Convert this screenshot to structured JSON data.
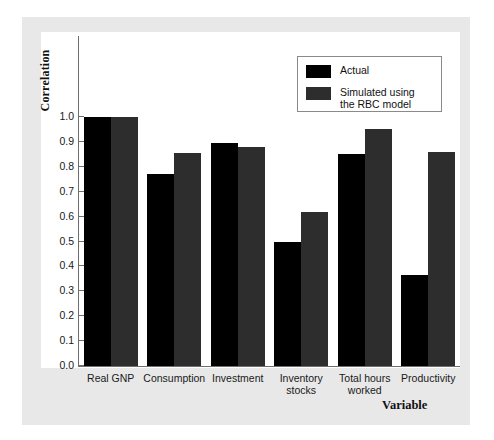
{
  "chart_data": {
    "type": "bar",
    "title": "",
    "xlabel": "Variable",
    "ylabel": "Correlation",
    "categories": [
      "Real GNP",
      "Consumption",
      "Investment",
      "Inventory stocks",
      "Total hours worked",
      "Productivity"
    ],
    "series": [
      {
        "name": "Actual",
        "color": "#000000",
        "values": [
          1.0,
          0.77,
          0.895,
          0.5,
          0.85,
          0.365
        ]
      },
      {
        "name": "Simulated using the RBC model",
        "color": "#2d2d2d",
        "values": [
          1.0,
          0.855,
          0.88,
          0.62,
          0.95,
          0.86
        ]
      }
    ],
    "ylim": [
      0.0,
      1.0
    ],
    "yticks": [
      "0.0",
      "0.1",
      "0.2",
      "0.3",
      "0.4",
      "0.5",
      "0.6",
      "0.7",
      "0.8",
      "0.9",
      "1.0"
    ],
    "grid": false,
    "legend_position": "top-right",
    "legend_entries": [
      "Actual",
      "Simulated using\nthe RBC model"
    ]
  },
  "figure": {
    "panel_color": "#e8e8e8",
    "canvas_color": "#ffffff",
    "axis_color": "#6e6e6e"
  }
}
